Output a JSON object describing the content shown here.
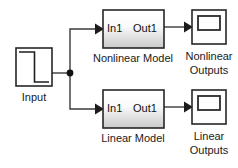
{
  "diagram": {
    "background_color": "#ffffff",
    "line_color": "#3a3a3a",
    "block_border_color": "#262626",
    "block_fill_top": "#ffffff",
    "block_fill_bottom": "#c9c9c9",
    "text_color": "#1a1a1a",
    "blocks": [
      {
        "id": "input-source",
        "type": "signal-source",
        "label": "Input",
        "icon": "step-signal-icon",
        "x": 16,
        "y": 48,
        "width": 36,
        "height": 38
      },
      {
        "id": "nonlinear-model",
        "type": "subsystem",
        "label": "Nonlinear Model",
        "input_port_label": "In1",
        "output_port_label": "Out1",
        "x": 103,
        "y": 10,
        "width": 61,
        "height": 38
      },
      {
        "id": "linear-model",
        "type": "subsystem",
        "label": "Linear Model",
        "input_port_label": "In1",
        "output_port_label": "Out1",
        "x": 103,
        "y": 90,
        "width": 61,
        "height": 38
      },
      {
        "id": "nonlinear-scope",
        "type": "scope",
        "label_line1": "Nonlinear",
        "label_line2": "Outputs",
        "icon": "scope-icon",
        "x": 192,
        "y": 10,
        "width": 34,
        "height": 34
      },
      {
        "id": "linear-scope",
        "type": "scope",
        "label_line1": "Linear",
        "label_line2": "Outputs",
        "icon": "scope-icon",
        "x": 192,
        "y": 90,
        "width": 34,
        "height": 34
      }
    ],
    "junction": {
      "id": "signal-branch-point",
      "x": 70,
      "y": 73,
      "radius": 3.4
    },
    "connections": [
      {
        "id": "input-to-branch",
        "from": "input-source",
        "to": "signal-branch-point"
      },
      {
        "id": "branch-to-nonlinear",
        "from": "signal-branch-point",
        "to": "nonlinear-model"
      },
      {
        "id": "branch-to-linear",
        "from": "signal-branch-point",
        "to": "linear-model"
      },
      {
        "id": "nonlinear-to-scope",
        "from": "nonlinear-model",
        "to": "nonlinear-scope"
      },
      {
        "id": "linear-to-scope",
        "from": "linear-model",
        "to": "linear-scope"
      }
    ]
  }
}
